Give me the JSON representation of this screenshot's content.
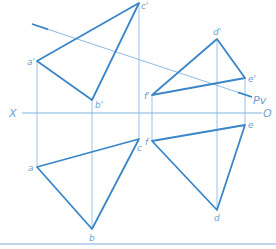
{
  "colors": {
    "thick": "#3a86c8",
    "thin": "#8dbbe3",
    "label": "#6f9fcf",
    "bottom_rule": "#a9c9e6"
  },
  "axis": {
    "left_label": "X",
    "right_label": "O",
    "y": 113,
    "x1": 22,
    "x2": 262
  },
  "trace": {
    "label": "Pv",
    "from": [
      32,
      24
    ],
    "to": [
      252,
      97
    ]
  },
  "triangles": {
    "abc_front": {
      "points": {
        "a'": [
          37,
          61
        ],
        "b'": [
          92,
          100
        ],
        "c'": [
          139,
          3
        ]
      },
      "labels": [
        "a'",
        "b'",
        "c'"
      ]
    },
    "abc_top": {
      "points": {
        "a": [
          37,
          167
        ],
        "b": [
          92,
          229
        ],
        "c": [
          139,
          139
        ]
      },
      "labels": [
        "a",
        "b",
        "c"
      ]
    },
    "def_front": {
      "points": {
        "d'": [
          217,
          39
        ],
        "e'": [
          245,
          78
        ],
        "f'": [
          152,
          95
        ]
      },
      "labels": [
        "d'",
        "e'",
        "f'"
      ]
    },
    "def_top": {
      "points": {
        "d": [
          217,
          210
        ],
        "e": [
          245,
          125
        ],
        "f": [
          152,
          141
        ]
      },
      "labels": [
        "d",
        "e",
        "f"
      ]
    }
  },
  "labels": {
    "a_prime": "a'",
    "b_prime": "b'",
    "c_prime": "c'",
    "d_prime": "d'",
    "e_prime": "e'",
    "f_prime": "f'",
    "a": "a",
    "b": "b",
    "c": "c",
    "d": "d",
    "e": "e",
    "f": "f",
    "pv": "Pv",
    "x": "X",
    "o": "O"
  }
}
